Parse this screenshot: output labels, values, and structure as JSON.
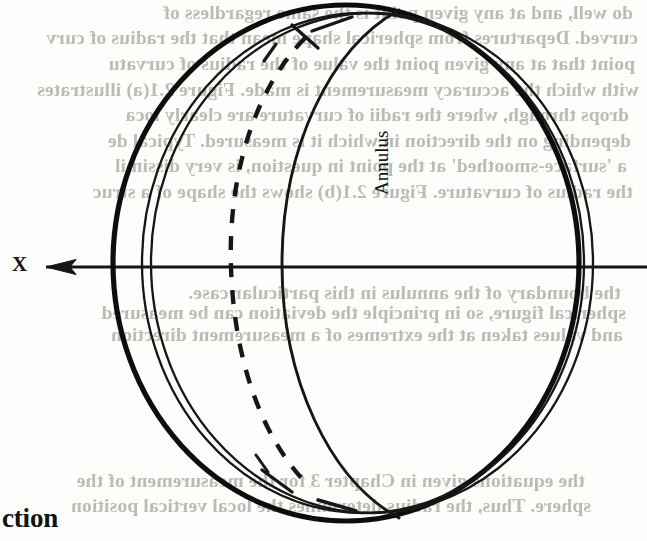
{
  "page": {
    "width": 647,
    "height": 541,
    "background_color": "#fdfdfb",
    "ink_color": "#131313",
    "bleed_text_color": "#b9b6b1"
  },
  "figure": {
    "name": "sphere-with-annulus-diagram",
    "axis": {
      "label": "X",
      "direction": "left",
      "arrowhead": "left-pointing"
    },
    "annulus_label": "Annulus"
  },
  "headings": {
    "section_fragment": "ction"
  },
  "bleed_through_lines": [
    {
      "text": "do well, and at any given point is the same regardless of",
      "top": 2,
      "left": 14
    },
    {
      "text": "curved. Departures from spherical shape mean that the radius of curv",
      "top": 27,
      "left": 9
    },
    {
      "text": "point that at any given point the value of the radius of curvatu",
      "top": 53,
      "left": 12
    },
    {
      "text": "with which the accuracy measurement is made. Figure 2.1(a) illustrates",
      "top": 79,
      "left": 8
    },
    {
      "text": "drops through, where the radii of curvature are clearly loca",
      "top": 104,
      "left": 18
    },
    {
      "text": "depending on the direction in which it is measured. Typical de",
      "top": 130,
      "left": 16
    },
    {
      "text": "a 'surface-smoothed' at the point in question, is very dissimil",
      "top": 155,
      "left": 20
    },
    {
      "text": "the radius of curvature. Figure 2.1(b) shows the shape of a struc",
      "top": 181,
      "left": 14
    },
    {
      "text": "the boundary of the annulus in this particular case.",
      "top": 282,
      "left": 26
    },
    {
      "text": "spherical figure, so in principle the deviation can be measured",
      "top": 302,
      "left": 21
    },
    {
      "text": "and values taken at the extremes of a measurement direction",
      "top": 324,
      "left": 24
    },
    {
      "text": "the equations given in Chapter 3 for the measurement of the",
      "top": 470,
      "left": 62
    },
    {
      "text": "sphere. Thus, the radius determines the local vertical position",
      "top": 495,
      "left": 56
    }
  ]
}
